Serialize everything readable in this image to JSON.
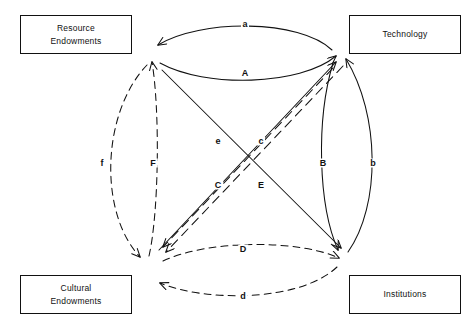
{
  "figure": {
    "type": "diagram",
    "style": "causal-loop / interaction diagram with four nodes and bidirectional arrow pairs"
  },
  "nodes": [
    {
      "id": "resource-endowments",
      "label": "Resource\nEndowments",
      "position": "top-left"
    },
    {
      "id": "technology",
      "label": "Technology",
      "position": "top-right"
    },
    {
      "id": "cultural-endowments",
      "label": "Cultural\nEndowments",
      "position": "bottom-left"
    },
    {
      "id": "institutions",
      "label": "Institutions",
      "position": "bottom-right"
    }
  ],
  "edge_labels": {
    "top_upper": "a",
    "top_lower": "A",
    "right_inner": "B",
    "right_outer": "b",
    "bottom_upper": "D",
    "bottom_lower": "d",
    "left_outer": "f",
    "left_inner": "F",
    "center_upper_left": "e",
    "center_upper_right": "c",
    "center_lower_left": "C",
    "center_lower_right": "E"
  },
  "edges": [
    {
      "label": "a",
      "from": "technology",
      "to": "resource-endowments",
      "line": "solid",
      "shape": "arc-top-outer"
    },
    {
      "label": "A",
      "from": "resource-endowments",
      "to": "technology",
      "line": "solid",
      "shape": "arc-top-inner"
    },
    {
      "label": "B",
      "from": "technology",
      "to": "institutions",
      "line": "solid",
      "shape": "arc-right-inner"
    },
    {
      "label": "b",
      "from": "institutions",
      "to": "technology",
      "line": "solid",
      "shape": "arc-right-outer"
    },
    {
      "label": "D",
      "from": "cultural-endowments",
      "to": "institutions",
      "line": "dashed",
      "shape": "arc-bottom-inner"
    },
    {
      "label": "d",
      "from": "institutions",
      "to": "cultural-endowments",
      "line": "dashed",
      "shape": "arc-bottom-outer"
    },
    {
      "label": "f",
      "from": "resource-endowments",
      "to": "cultural-endowments",
      "line": "dashed",
      "shape": "arc-left-outer"
    },
    {
      "label": "F",
      "from": "cultural-endowments",
      "to": "resource-endowments",
      "line": "dashed",
      "shape": "arc-left-inner"
    },
    {
      "label": "e",
      "from": "institutions",
      "to": "resource-endowments",
      "line": "dashed",
      "shape": "diagonal"
    },
    {
      "label": "E",
      "from": "resource-endowments",
      "to": "institutions",
      "line": "solid",
      "shape": "diagonal"
    },
    {
      "label": "c",
      "from": "cultural-endowments",
      "to": "technology",
      "line": "solid",
      "shape": "diagonal"
    },
    {
      "label": "C",
      "from": "technology",
      "to": "cultural-endowments",
      "line": "dashed",
      "shape": "diagonal"
    }
  ],
  "colors": {
    "stroke": "#111111",
    "background": "#ffffff",
    "text": "#111111"
  }
}
